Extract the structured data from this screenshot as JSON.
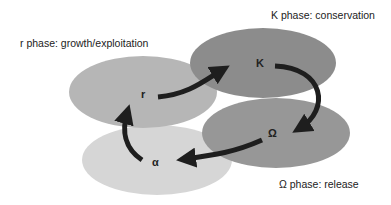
{
  "labels": {
    "r_phase": "r phase: growth/exploitation",
    "k_phase": "K phase: conservation",
    "omega_phase": "Ω phase: release"
  },
  "nodes": {
    "r": "r",
    "k": "K",
    "omega": "Ω",
    "alpha": "α"
  },
  "colors": {
    "k_fill": "#8c8c8c",
    "r_fill": "#b6b6b6",
    "omega_fill": "#979797",
    "alpha_fill": "#d6d6d6",
    "arrow": "#1e1e1e"
  }
}
